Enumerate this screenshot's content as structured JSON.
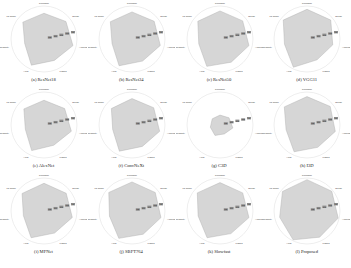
{
  "chart_data": [
    {
      "type": "radar",
      "title": "(a) ResNet18",
      "axes": [
        "Precision",
        "Recall",
        "Accuracy",
        "Kappa",
        "AUC",
        "Specificity",
        "F1-score"
      ],
      "values": [
        0.78,
        0.85,
        0.9,
        0.72,
        0.88,
        0.6,
        0.82
      ],
      "ticks": [
        "0.2",
        "0.4",
        "0.6",
        "0.8",
        "1"
      ]
    },
    {
      "type": "radar",
      "title": "(b) ResNet34",
      "axes": [
        "Precision",
        "Recall",
        "Accuracy",
        "Kappa",
        "AUC",
        "Specificity",
        "F1-score"
      ],
      "values": [
        0.82,
        0.86,
        0.88,
        0.74,
        0.9,
        0.62,
        0.84
      ],
      "ticks": [
        "0.2",
        "0.4",
        "0.6",
        "0.8",
        "1"
      ]
    },
    {
      "type": "radar",
      "title": "(c) ResNet50",
      "axes": [
        "Precision",
        "Recall",
        "Accuracy",
        "Kappa",
        "AUC",
        "Specificity",
        "F1-score"
      ],
      "values": [
        0.85,
        0.88,
        0.9,
        0.78,
        0.92,
        0.66,
        0.86
      ],
      "ticks": [
        "0.2",
        "0.4",
        "0.6",
        "0.8",
        "1"
      ]
    },
    {
      "type": "radar",
      "title": "(d) VGG11",
      "axes": [
        "Precision",
        "Recall",
        "Accuracy",
        "Kappa",
        "AUC",
        "Specificity",
        "F1-score"
      ],
      "values": [
        0.9,
        0.92,
        0.8,
        0.7,
        0.95,
        0.7,
        0.92
      ],
      "ticks": [
        "0.2",
        "0.4",
        "0.6",
        "0.8",
        "1"
      ]
    },
    {
      "type": "radar",
      "title": "(e) AlexNet",
      "axes": [
        "Precision",
        "Recall",
        "Accuracy",
        "Kappa",
        "AUC",
        "Specificity",
        "F1-score"
      ],
      "values": [
        0.75,
        0.8,
        0.85,
        0.68,
        0.86,
        0.58,
        0.78
      ],
      "ticks": [
        "0.2",
        "0.4",
        "0.6",
        "0.8",
        "1"
      ]
    },
    {
      "type": "radar",
      "title": "(f) ConvNeXt",
      "axes": [
        "Precision",
        "Recall",
        "Accuracy",
        "Kappa",
        "AUC",
        "Specificity",
        "F1-score"
      ],
      "values": [
        0.8,
        0.84,
        0.86,
        0.72,
        0.88,
        0.6,
        0.8
      ],
      "ticks": [
        "0.2",
        "0.4",
        "0.6",
        "0.8",
        "1"
      ]
    },
    {
      "type": "radar",
      "title": "(g) C3D",
      "axes": [
        "Precision",
        "Recall",
        "Accuracy",
        "Kappa",
        "AUC",
        "Specificity",
        "F1-score"
      ],
      "values": [
        0.3,
        0.35,
        0.4,
        0.3,
        0.35,
        0.3,
        0.3
      ],
      "ticks": [
        "0.2",
        "0.4",
        "0.6",
        "0.8",
        "1"
      ]
    },
    {
      "type": "radar",
      "title": "(h) I3D",
      "axes": [
        "Precision",
        "Recall",
        "Accuracy",
        "Kappa",
        "AUC",
        "Specificity",
        "F1-score"
      ],
      "values": [
        0.86,
        0.9,
        0.88,
        0.75,
        0.9,
        0.65,
        0.88
      ],
      "ticks": [
        "0.2",
        "0.4",
        "0.6",
        "0.8",
        "1"
      ]
    },
    {
      "type": "radar",
      "title": "(i) MFNet",
      "axes": [
        "Precision",
        "Recall",
        "Accuracy",
        "Kappa",
        "AUC",
        "Specificity",
        "F1-score"
      ],
      "values": [
        0.84,
        0.86,
        0.88,
        0.74,
        0.9,
        0.64,
        0.85
      ],
      "ticks": [
        "0.2",
        "0.4",
        "0.6",
        "0.8",
        "1"
      ]
    },
    {
      "type": "radar",
      "title": "(j) SBFT764",
      "axes": [
        "Precision",
        "Recall",
        "Accuracy",
        "Kappa",
        "AUC",
        "Specificity",
        "F1-score"
      ],
      "values": [
        0.88,
        0.9,
        0.9,
        0.78,
        0.92,
        0.7,
        0.9
      ],
      "ticks": [
        "0.2",
        "0.4",
        "0.6",
        "0.8",
        "1"
      ]
    },
    {
      "type": "radar",
      "title": "(k) Slowfast",
      "axes": [
        "Precision",
        "Recall",
        "Accuracy",
        "Kappa",
        "AUC",
        "Specificity",
        "F1-score"
      ],
      "values": [
        0.86,
        0.88,
        0.9,
        0.76,
        0.9,
        0.68,
        0.88
      ],
      "ticks": [
        "0.2",
        "0.4",
        "0.6",
        "0.8",
        "1"
      ]
    },
    {
      "type": "radar",
      "title": "(l) Proposed",
      "axes": [
        "Precision",
        "Recall",
        "Accuracy",
        "Kappa",
        "AUC",
        "Specificity",
        "F1-score"
      ],
      "values": [
        0.95,
        0.96,
        0.97,
        0.88,
        0.97,
        0.85,
        0.95
      ],
      "ticks": [
        "0.2",
        "0.4",
        "0.6",
        "0.8",
        "1"
      ]
    }
  ],
  "colors": {
    "fill": "#c8c8c8",
    "fill_opacity": "0.75",
    "grid": "#dddddd",
    "outline": "#aaaaaa",
    "text": "#222222"
  }
}
